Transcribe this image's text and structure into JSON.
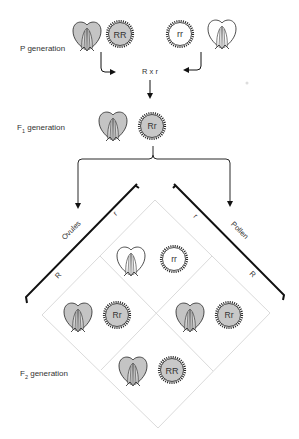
{
  "labels": {
    "p_generation": "P generation",
    "f1_prefix": "F",
    "f1_sub": "1",
    "f1_suffix": " generation",
    "f2_prefix": "F",
    "f2_sub": "2",
    "f2_suffix": " generation",
    "cross": "R x r",
    "ovules": "Ovules",
    "pollen": "Pollen"
  },
  "gametes": {
    "ovules_top": "r",
    "ovules_bottom": "R",
    "pollen_top": "r",
    "pollen_bottom": "R"
  },
  "genotypes": {
    "p_left": "RR",
    "p_right": "rr",
    "f1": "Rr",
    "f2_top": "rr",
    "f2_left": "Rr",
    "f2_right": "Rr",
    "f2_bottom": "RR"
  },
  "colors": {
    "red_fill": "#c8c8c8",
    "white_fill": "#ffffff",
    "line": "#111111",
    "grid": "#d6d6d6",
    "text": "#333333"
  }
}
